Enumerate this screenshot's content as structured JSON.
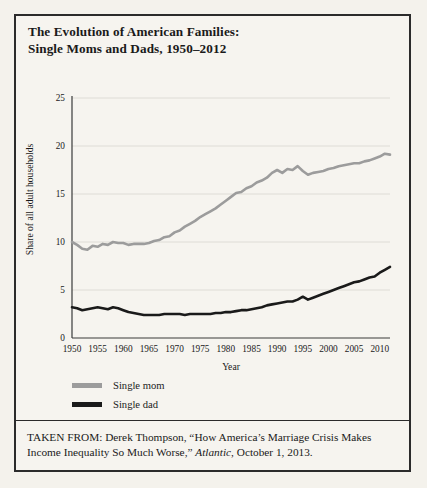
{
  "title": {
    "line1": "The Evolution of American Families:",
    "line2": "Single Moms and Dads, 1950–2012"
  },
  "caption": {
    "prefix": "TAKEN FROM: Derek Thompson, “How America’s Marriage Crisis Makes Income Inequality So Much Worse,” ",
    "source": "Atlantic",
    "suffix": ", October 1, 2013."
  },
  "colors": {
    "single_mom": "#9c9c9c",
    "single_dad": "#1a1a1a",
    "axis": "#3a3a3a",
    "grid": "#dedcd6",
    "background": "#f6f4ef",
    "border": "#2b2b2b"
  },
  "chart_data": {
    "type": "line",
    "title": "The Evolution of American Families: Single Moms and Dads, 1950–2012",
    "xlabel": "Year",
    "ylabel": "Share of all adult households",
    "xlim": [
      1950,
      2012
    ],
    "ylim": [
      0,
      25
    ],
    "xticks": [
      1950,
      1955,
      1960,
      1965,
      1970,
      1975,
      1980,
      1985,
      1990,
      1995,
      2000,
      2005,
      2010
    ],
    "yticks": [
      0,
      5,
      10,
      15,
      20,
      25
    ],
    "grid": true,
    "legend_position": "below-left",
    "x": [
      1950,
      1951,
      1952,
      1953,
      1954,
      1955,
      1956,
      1957,
      1958,
      1959,
      1960,
      1961,
      1962,
      1963,
      1964,
      1965,
      1966,
      1967,
      1968,
      1969,
      1970,
      1971,
      1972,
      1973,
      1974,
      1975,
      1976,
      1977,
      1978,
      1979,
      1980,
      1981,
      1982,
      1983,
      1984,
      1985,
      1986,
      1987,
      1988,
      1989,
      1990,
      1991,
      1992,
      1993,
      1994,
      1995,
      1996,
      1997,
      1998,
      1999,
      2000,
      2001,
      2002,
      2003,
      2004,
      2005,
      2006,
      2007,
      2008,
      2009,
      2010,
      2011,
      2012
    ],
    "series": [
      {
        "name": "Single mom",
        "color": "#9c9c9c",
        "values": [
          10.0,
          9.7,
          9.3,
          9.2,
          9.6,
          9.5,
          9.8,
          9.7,
          10.0,
          9.9,
          9.9,
          9.7,
          9.8,
          9.8,
          9.8,
          9.9,
          10.1,
          10.2,
          10.5,
          10.6,
          11.0,
          11.2,
          11.6,
          11.9,
          12.2,
          12.6,
          12.9,
          13.2,
          13.5,
          13.9,
          14.3,
          14.7,
          15.1,
          15.2,
          15.6,
          15.8,
          16.2,
          16.4,
          16.7,
          17.2,
          17.5,
          17.2,
          17.6,
          17.5,
          17.9,
          17.4,
          17.0,
          17.2,
          17.3,
          17.4,
          17.6,
          17.7,
          17.9,
          18.0,
          18.1,
          18.2,
          18.2,
          18.4,
          18.5,
          18.7,
          18.9,
          19.2,
          19.1
        ]
      },
      {
        "name": "Single dad",
        "color": "#1a1a1a",
        "values": [
          3.2,
          3.1,
          2.9,
          3.0,
          3.1,
          3.2,
          3.1,
          3.0,
          3.2,
          3.1,
          2.9,
          2.7,
          2.6,
          2.5,
          2.4,
          2.4,
          2.4,
          2.4,
          2.5,
          2.5,
          2.5,
          2.5,
          2.4,
          2.5,
          2.5,
          2.5,
          2.5,
          2.5,
          2.6,
          2.6,
          2.7,
          2.7,
          2.8,
          2.9,
          2.9,
          3.0,
          3.1,
          3.2,
          3.4,
          3.5,
          3.6,
          3.7,
          3.8,
          3.8,
          4.0,
          4.3,
          4.0,
          4.2,
          4.4,
          4.6,
          4.8,
          5.0,
          5.2,
          5.4,
          5.6,
          5.8,
          5.9,
          6.1,
          6.3,
          6.4,
          6.8,
          7.1,
          7.4
        ]
      }
    ]
  }
}
